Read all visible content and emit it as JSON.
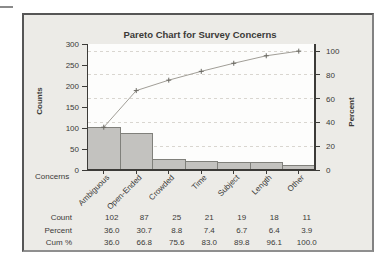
{
  "chart_data": {
    "type": "pareto",
    "title": "Pareto Chart for Survey Concerns",
    "categories": [
      "Ambiguous",
      "Open-Ended",
      "Crowded",
      "Time",
      "Subject",
      "Length",
      "Other"
    ],
    "series": [
      {
        "name": "Count",
        "type": "bar",
        "axis": "left",
        "values": [
          102,
          87,
          25,
          21,
          19,
          18,
          11
        ]
      },
      {
        "name": "Cumulative Percent",
        "type": "line",
        "axis": "right",
        "values": [
          36.0,
          66.8,
          75.6,
          83.0,
          89.8,
          96.1,
          100.0
        ]
      }
    ],
    "left_axis": {
      "label": "Counts",
      "range": [
        0,
        300
      ],
      "ticks": [
        0,
        50,
        100,
        150,
        200,
        250,
        300
      ]
    },
    "right_axis": {
      "label": "Percent",
      "range": [
        0,
        100
      ],
      "ticks": [
        0,
        20,
        40,
        60,
        80,
        100
      ]
    },
    "x_axis": {
      "label": "Concerns"
    },
    "grid": {
      "orientation": "horizontal",
      "style": "dashed",
      "at_right_ticks": [
        20,
        40,
        60,
        80,
        100
      ]
    },
    "summary_table": {
      "rows": [
        {
          "label": "Count",
          "values": [
            "102",
            "87",
            "25",
            "21",
            "19",
            "18",
            "11"
          ]
        },
        {
          "label": "Percent",
          "values": [
            "36.0",
            "30.7",
            "8.8",
            "7.4",
            "6.7",
            "6.4",
            "3.9"
          ]
        },
        {
          "label": "Cum %",
          "values": [
            "36.0",
            "66.8",
            "75.6",
            "83.0",
            "89.8",
            "96.1",
            "100.0"
          ]
        }
      ]
    }
  },
  "colors": {
    "page_background": "#FFFFFF",
    "frame_background": "#ECEBE7",
    "frame_border": "#5C5C5C",
    "plot_background": "#FDFDFC",
    "bar_fill": "#C3C2BF",
    "bar_border": "#80807B",
    "line": "#A19E97",
    "marker": "#6A6862",
    "grid": "#D9D6D0",
    "axis": "#3C3B38",
    "text": "#3B3A37",
    "dash_mark": "#8A8A8A"
  }
}
